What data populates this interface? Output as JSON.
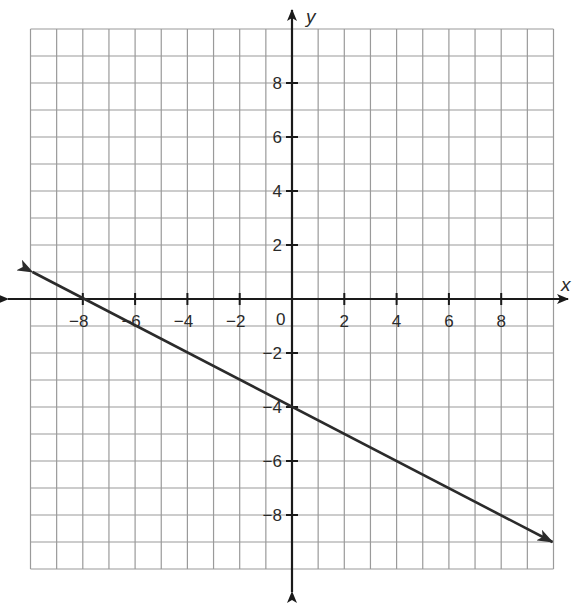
{
  "chart_data": {
    "type": "line",
    "title": "",
    "xlabel": "x",
    "ylabel": "y",
    "xlim": [
      -10,
      10
    ],
    "ylim": [
      -10,
      10
    ],
    "grid": true,
    "grid_step": 1,
    "x_ticks": [
      -8,
      -6,
      -4,
      -2,
      2,
      4,
      6,
      8
    ],
    "y_ticks": [
      -8,
      -6,
      -4,
      -2,
      2,
      4,
      6,
      8
    ],
    "x_tick_labels": [
      "−8",
      "−6",
      "−4",
      "−2",
      "2",
      "4",
      "6",
      "8"
    ],
    "y_tick_labels": [
      "−8",
      "−6",
      "−4",
      "−2",
      "2",
      "4",
      "6",
      "8"
    ],
    "origin_label": "0",
    "series": [
      {
        "name": "line",
        "equation": "y = -x/2 - 4",
        "slope": -0.5,
        "intercept": -4,
        "x_intercept": -8,
        "points": [
          [
            -10,
            1
          ],
          [
            -8,
            0
          ],
          [
            0,
            -4
          ],
          [
            10,
            -9
          ]
        ],
        "arrows_both_ends": true
      }
    ]
  },
  "colors": {
    "grid": "#9a9a9a",
    "axis": "#1a1a1a",
    "line": "#2b2b2b",
    "text": "#2a2a2a"
  }
}
